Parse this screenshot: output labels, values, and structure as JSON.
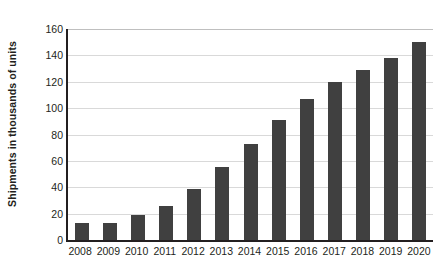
{
  "chart_data": {
    "type": "bar",
    "title": "",
    "subtitle": "",
    "xlabel": "",
    "ylabel": "Shipments in thousands of units",
    "categories": [
      "2008",
      "2009",
      "2010",
      "2011",
      "2012",
      "2013",
      "2014",
      "2015",
      "2016",
      "2017",
      "2018",
      "2019",
      "2020"
    ],
    "values": [
      13,
      13,
      19,
      26,
      39,
      55,
      73,
      91,
      107,
      120,
      129,
      138,
      150
    ],
    "series": [
      {
        "name": "Shipments",
        "values": [
          13,
          13,
          19,
          26,
          39,
          55,
          73,
          91,
          107,
          120,
          129,
          138,
          150
        ]
      }
    ],
    "ylim": [
      0,
      160
    ],
    "ytick_step": 20,
    "yticks": [
      0,
      20,
      40,
      60,
      80,
      100,
      120,
      140,
      160
    ],
    "ytick_labels": [
      "0",
      "20",
      "40",
      "60",
      "80",
      "100",
      "120",
      "140",
      "160"
    ],
    "grid": "horizontal",
    "legend": "none",
    "legend_position": "none",
    "colors": {
      "bar_fill": "#404040",
      "gridline": "#d9d9d9",
      "axis": "#231f20",
      "background": "#ffffff",
      "text": "#231f20"
    }
  }
}
